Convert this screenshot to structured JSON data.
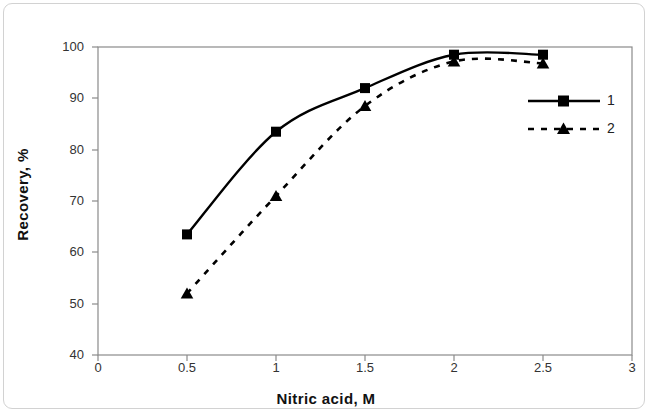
{
  "chart_data": {
    "type": "line",
    "title": "",
    "xlabel": "Nitric acid, M",
    "ylabel": "Recovery, %",
    "xlim": [
      0,
      3
    ],
    "ylim": [
      40,
      100
    ],
    "xticks": [
      "0",
      "0.5",
      "1",
      "1.5",
      "2",
      "2.5",
      "3"
    ],
    "xtick_values": [
      0,
      0.5,
      1,
      1.5,
      2,
      2.5,
      3
    ],
    "yticks": [
      "40",
      "50",
      "60",
      "70",
      "80",
      "90",
      "100"
    ],
    "ytick_values": [
      40,
      50,
      60,
      70,
      80,
      90,
      100
    ],
    "grid": false,
    "legend_position": "right",
    "x": [
      0.5,
      1,
      1.5,
      2,
      2.5
    ],
    "series": [
      {
        "name": "1",
        "marker": "square",
        "line_style": "solid",
        "color": "#000000",
        "values": [
          63.5,
          83.5,
          92.0,
          98.5,
          98.5
        ]
      },
      {
        "name": "2",
        "marker": "triangle",
        "line_style": "dashed",
        "color": "#000000",
        "values": [
          52.0,
          71.0,
          88.5,
          97.2,
          96.8
        ]
      }
    ]
  },
  "legend": {
    "entries": [
      {
        "label": "1"
      },
      {
        "label": "2"
      }
    ]
  },
  "frame": {
    "border_color": "#d2d2d2",
    "axis_color": "#808080",
    "plot_background": "#ffffff"
  }
}
